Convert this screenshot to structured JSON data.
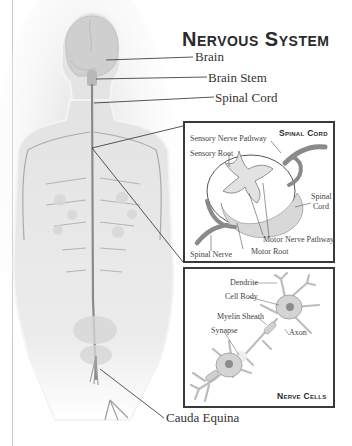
{
  "title": "Nervous System",
  "body_labels": {
    "brain": "Brain",
    "brain_stem": "Brain Stem",
    "spinal_cord": "Spinal Cord",
    "cauda_equina": "Cauda Equina"
  },
  "spinal_cord_panel": {
    "title": "Spinal Cord",
    "labels": {
      "sensory_nerve_pathway": "Sensory Nerve Pathway",
      "sensory_root": "Sensory Root",
      "spinal_cord_1": "Spinal",
      "spinal_cord_2": "Cord",
      "motor_nerve_pathway": "Motor Nerve Pathway",
      "motor_root": "Motor Root",
      "spinal_nerve": "Spinal Nerve"
    }
  },
  "nerve_cells_panel": {
    "title": "Nerve Cells",
    "labels": {
      "dendrite": "Dendrite",
      "cell_body": "Cell Body",
      "myelin_sheath": "Myelin Sheath",
      "synapse": "Synapse",
      "axon": "Axon"
    }
  },
  "colors": {
    "body_fill": "#e6e6e6",
    "organ_fill": "#cfcfcf",
    "nerve": "#8a8a8a",
    "line": "#444444",
    "box_border": "#3a3a3a"
  }
}
